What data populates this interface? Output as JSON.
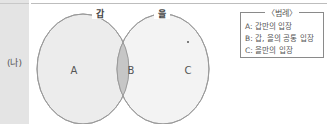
{
  "row_label": "(나)",
  "sets": [
    {
      "name": "갑",
      "region": "A"
    },
    {
      "name": "을",
      "region": "C"
    }
  ],
  "regions": {
    "left": "A",
    "intersection": "B",
    "right": "C"
  },
  "legend": {
    "title": "〈범례〉",
    "items": [
      {
        "key": "A",
        "text": "A: 갑만의 입장"
      },
      {
        "key": "B",
        "text": "B: 갑, 을의 공통 입장"
      },
      {
        "key": "C",
        "text": "C: 을만의 입장"
      }
    ]
  },
  "colors": {
    "circle_fill": "#ececec",
    "intersection_fill": "#c6c6c6",
    "circle_stroke": "#9a9a9a",
    "label_column": "#e4e4e4"
  }
}
